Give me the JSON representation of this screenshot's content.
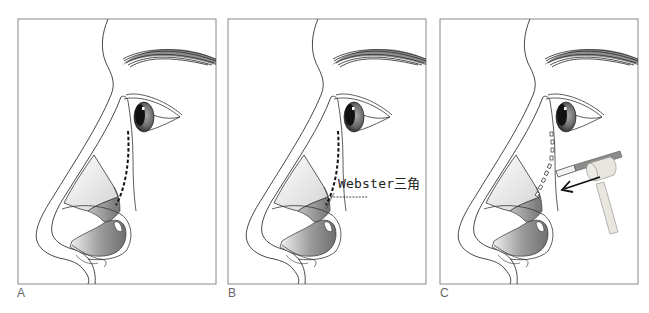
{
  "figure": {
    "panels": [
      {
        "id": "A",
        "label": "A",
        "content": "Nose profile with dashed osteotomy line along nasal sidewall"
      },
      {
        "id": "B",
        "label": "B",
        "content": "Nose profile with dashed osteotomy line and Webster triangle annotation",
        "annotation": "Webster三角"
      },
      {
        "id": "C",
        "label": "C",
        "content": "Osteotome with mallet applied along perforated osteotomy line",
        "arrow": "direction of force toward nose"
      }
    ],
    "colors": {
      "frame": "#8a8a8a",
      "line": "#333333",
      "shade_dark": "#7d7d7d",
      "shade_light": "#e6e6e6",
      "osteotome_shaft": "#8c8c8c",
      "mallet": "#e8e6df"
    }
  }
}
